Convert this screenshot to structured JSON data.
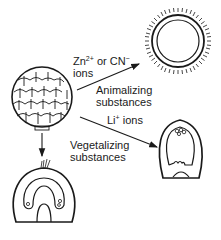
{
  "diagram": {
    "labels": {
      "zn_line1_a": "Zn",
      "zn_line1_sup1": "2+",
      "zn_line1_b": " or CN",
      "zn_line1_sup2": "−",
      "zn_line2": "ions",
      "animalizing_1": "Animalizing",
      "animalizing_2": "substances",
      "li_a": "Li",
      "li_sup": "+",
      "li_b": " ions",
      "vegetalizing_1": "Vegetalizing",
      "vegetalizing_2": "substances"
    },
    "nodes": [
      {
        "id": "blastula",
        "name": "sea urchin blastula (cleaved embryo)"
      },
      {
        "id": "animalized",
        "name": "animalized embryo (ciliated sphere)"
      },
      {
        "id": "vegetalized",
        "name": "vegetalized embryo"
      },
      {
        "id": "normal",
        "name": "normal gastrula"
      }
    ],
    "edges": [
      {
        "from": "blastula",
        "to": "animalized",
        "label": "Zn2+ or CN- ions / Animalizing substances"
      },
      {
        "from": "blastula",
        "to": "vegetalized",
        "label": "Li+ ions / Vegetalizing substances"
      },
      {
        "from": "blastula",
        "to": "normal",
        "label": ""
      }
    ],
    "colors": {
      "ink": "#1a1a1a",
      "background": "#ffffff"
    }
  }
}
